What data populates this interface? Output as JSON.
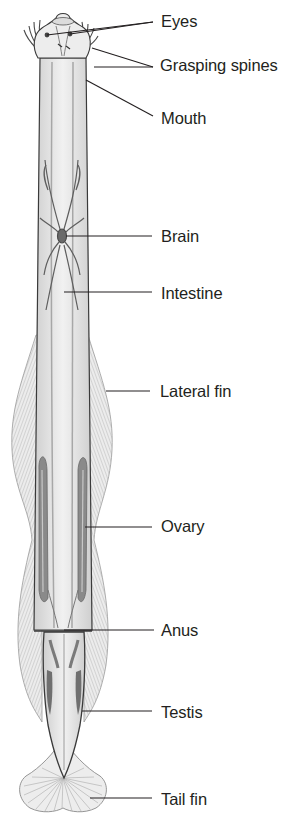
{
  "figure": {
    "colors": {
      "body_fill": "#d9d9d9",
      "body_light": "#ececec",
      "outline": "#3a3a3a",
      "organ": "#8c8c8c",
      "fin_fill": "#e6e6e6",
      "fin_rays": "#b5b5b5",
      "leader_line": "#231f20",
      "label_text": "#231f20"
    },
    "labels": [
      {
        "id": "eyes",
        "text": "Eyes",
        "x": 161,
        "y": 20
      },
      {
        "id": "grasping-spines",
        "text": "Grasping spines",
        "x": 160,
        "y": 63
      },
      {
        "id": "mouth",
        "text": "Mouth",
        "x": 161,
        "y": 116
      },
      {
        "id": "brain",
        "text": "Brain",
        "x": 161,
        "y": 236
      },
      {
        "id": "intestine",
        "text": "Intestine",
        "x": 161,
        "y": 292
      },
      {
        "id": "lateral-fin",
        "text": "Lateral fin",
        "x": 160,
        "y": 390
      },
      {
        "id": "ovary",
        "text": "Ovary",
        "x": 161,
        "y": 517
      },
      {
        "id": "anus",
        "text": "Anus",
        "x": 161,
        "y": 625
      },
      {
        "id": "testis",
        "text": "Testis",
        "x": 161,
        "y": 705
      },
      {
        "id": "tail-fin",
        "text": "Tail fin",
        "x": 161,
        "y": 792
      }
    ]
  }
}
